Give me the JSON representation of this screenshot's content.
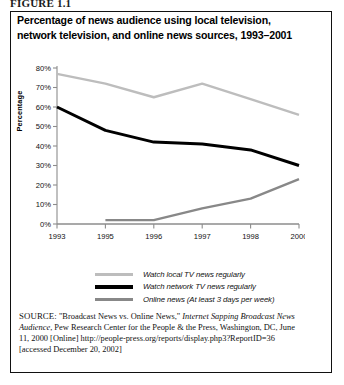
{
  "figure": {
    "label": "FIGURE 1.1"
  },
  "chart_title": "Percentage of news audience using local television, network television, and online news sources, 1993–2001",
  "legend": {
    "items": [
      {
        "label": "Watch local TV news regularly",
        "color": "#bdbdbd",
        "swatch": "light-gray-line"
      },
      {
        "label": "Watch network TV news regularly",
        "color": "#000000",
        "swatch": "black-line"
      },
      {
        "label": "Online news (At least 3 days per week)",
        "color": "#888888",
        "swatch": "medium-gray-line"
      }
    ]
  },
  "source": {
    "kicker": "SOURCE:",
    "text_1": " \"Broadcast News vs. Online News,\" ",
    "italic_1": "Internet Sapping Broadcast News Audience",
    "text_2": ", Pew Research Center for the People & the Press, Washington, DC, June 11, 2000 [Online] http://people-press.org/reports/display.php3?ReportID=36 [accessed December 20, 2002]"
  },
  "chart_data": {
    "type": "line",
    "title": "Percentage of news audience using local television, network television, and online news sources, 1993–2001",
    "xlabel": "",
    "ylabel": "Percentage",
    "categories": [
      "1993",
      "1995",
      "1996",
      "1997",
      "1998",
      "2000"
    ],
    "x_tick_labels": [
      "1993",
      "1995",
      "1996",
      "1997",
      "1998",
      "2000"
    ],
    "y_tick_labels": [
      "0%",
      "10%",
      "20%",
      "30%",
      "40%",
      "50%",
      "60%",
      "70%",
      "80%"
    ],
    "ylim": [
      0,
      80
    ],
    "y_tick_step": 10,
    "grid": false,
    "legend_position": "bottom",
    "series": [
      {
        "name": "Watch local TV news regularly",
        "color": "#bdbdbd",
        "values": [
          77,
          72,
          65,
          72,
          64,
          56
        ]
      },
      {
        "name": "Watch network TV news regularly",
        "color": "#000000",
        "values": [
          60,
          48,
          42,
          41,
          38,
          30
        ]
      },
      {
        "name": "Online news (At least 3 days per week)",
        "color": "#888888",
        "values": [
          null,
          2,
          2,
          8,
          13,
          23
        ]
      }
    ]
  }
}
